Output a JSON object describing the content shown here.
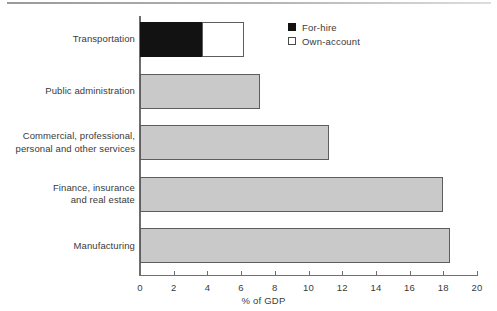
{
  "chart_data": {
    "type": "bar",
    "orientation": "horizontal",
    "title": "",
    "xlabel": "% of GDP",
    "ylabel": "",
    "xlim": [
      0,
      20
    ],
    "xticks": [
      0,
      2,
      4,
      6,
      8,
      10,
      12,
      14,
      16,
      18,
      20
    ],
    "xtick_labels": [
      "0",
      "2",
      "4",
      "6",
      "8",
      "10",
      "12",
      "14",
      "16",
      "18",
      "20"
    ],
    "grid": false,
    "legend_position": "top-right",
    "categories": [
      "Transportation",
      "Public administration",
      "Commercial, professional, personal and other services",
      "Finance, insurance and real estate",
      "Manufacturing"
    ],
    "series": [
      {
        "name": "For-hire",
        "color": "#121212",
        "values": [
          3.7,
          null,
          null,
          null,
          null
        ]
      },
      {
        "name": "Own-account",
        "color": "#ffffff",
        "values": [
          2.5,
          null,
          null,
          null,
          null
        ]
      },
      {
        "name": "Total",
        "color": "#c9c9c9",
        "values": [
          6.2,
          7.1,
          11.2,
          18.0,
          18.4
        ]
      }
    ],
    "bars": [
      {
        "category": "Transportation",
        "label_lines": [
          "Transportation"
        ],
        "total": 6.2,
        "segments": [
          {
            "series": "For-hire",
            "start": 0,
            "end": 3.7,
            "style": "black"
          },
          {
            "series": "Own-account",
            "start": 3.7,
            "end": 6.2,
            "style": "white"
          }
        ]
      },
      {
        "category": "Public administration",
        "label_lines": [
          "Public administration"
        ],
        "total": 7.1,
        "segments": [
          {
            "series": "Total",
            "start": 0,
            "end": 7.1,
            "style": "gray"
          }
        ]
      },
      {
        "category": "Commercial, professional, personal and other services",
        "label_lines": [
          "Commercial, professional,",
          "personal and other services"
        ],
        "total": 11.2,
        "segments": [
          {
            "series": "Total",
            "start": 0,
            "end": 11.2,
            "style": "gray"
          }
        ]
      },
      {
        "category": "Finance, insurance and real estate",
        "label_lines": [
          "Finance, insurance",
          "and real estate"
        ],
        "total": 18.0,
        "segments": [
          {
            "series": "Total",
            "start": 0,
            "end": 18.0,
            "style": "gray"
          }
        ]
      },
      {
        "category": "Manufacturing",
        "label_lines": [
          "Manufacturing"
        ],
        "total": 18.4,
        "segments": [
          {
            "series": "Total",
            "start": 0,
            "end": 18.4,
            "style": "gray"
          }
        ]
      }
    ],
    "legend": [
      {
        "label": "For-hire",
        "swatch": "filled"
      },
      {
        "label": "Own-account",
        "swatch": "hollow"
      }
    ]
  },
  "labels": {
    "cat_0_line_0": "Transportation",
    "cat_1_line_0": "Public administration",
    "cat_2_line_0": "Commercial, professional,",
    "cat_2_line_1": "personal and other services",
    "cat_3_line_0": "Finance, insurance",
    "cat_3_line_1": "and real estate",
    "cat_4_line_0": "Manufacturing",
    "axis_title": "% of GDP",
    "legend_0": "For-hire",
    "legend_1": "Own-account"
  }
}
